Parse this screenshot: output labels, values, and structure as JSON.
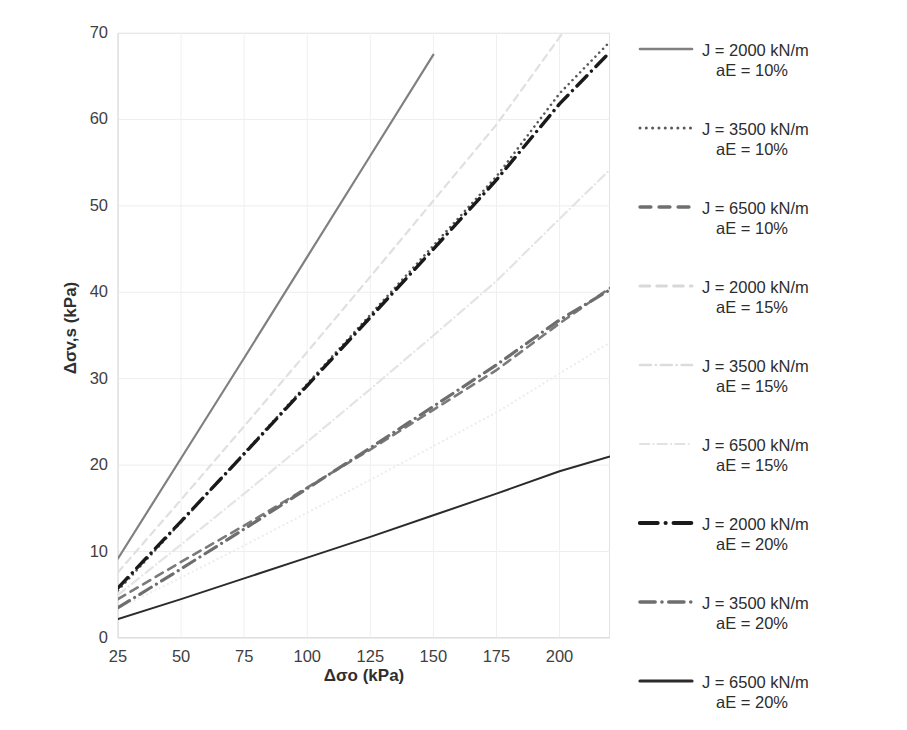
{
  "chart_data": {
    "type": "line",
    "title": "",
    "xlabel": "Δσo (kPa)",
    "ylabel": "Δσv,s (kPa)",
    "xlim": [
      25,
      220
    ],
    "ylim": [
      0,
      70
    ],
    "xticks": [
      25,
      50,
      75,
      100,
      125,
      150,
      175,
      200
    ],
    "yticks": [
      0,
      10,
      20,
      30,
      40,
      50,
      60,
      70
    ],
    "grid": true,
    "legend_position": "right",
    "series": [
      {
        "name": "J = 2000 kN/m  aE = 10%",
        "J": 2000,
        "aE": "10%",
        "style": "solid",
        "color": "#808080",
        "width": 2.2,
        "x": [
          25,
          50,
          75,
          100,
          125,
          150
        ],
        "y": [
          9.2,
          20.8,
          32.4,
          44.1,
          55.8,
          67.5
        ]
      },
      {
        "name": "J = 3500 kN/m  aE = 10%",
        "J": 3500,
        "aE": "10%",
        "style": "dotted",
        "color": "#595959",
        "width": 2.6,
        "x": [
          25,
          50,
          75,
          100,
          125,
          150,
          175,
          200,
          220
        ],
        "y": [
          5.5,
          13.4,
          21.4,
          29.4,
          37.4,
          45.4,
          53.4,
          63.0,
          69.0
        ]
      },
      {
        "name": "J = 6500 kN/m  aE = 10%",
        "J": 6500,
        "aE": "10%",
        "style": "dashed",
        "color": "#7a7a7a",
        "width": 2.6,
        "x": [
          25,
          50,
          75,
          100,
          125,
          150,
          175,
          200,
          220
        ],
        "y": [
          4.5,
          8.8,
          13.0,
          17.4,
          21.8,
          26.4,
          31.0,
          36.4,
          40.5
        ]
      },
      {
        "name": "J = 2000 kN/m  aE = 15%",
        "J": 2000,
        "aE": "15%",
        "style": "dashed",
        "color": "#e0e0e0",
        "width": 2.2,
        "x": [
          25,
          50,
          75,
          100,
          125,
          150,
          175,
          200,
          213
        ],
        "y": [
          7.6,
          16.0,
          24.5,
          33.1,
          41.8,
          50.6,
          59.4,
          69.5,
          75.0
        ]
      },
      {
        "name": "J = 3500 kN/m  aE = 15%",
        "J": 3500,
        "aE": "15%",
        "style": "dashdot",
        "color": "#e4e4e4",
        "width": 2.2,
        "x": [
          25,
          50,
          75,
          100,
          125,
          150,
          175,
          200,
          220
        ],
        "y": [
          5.0,
          10.8,
          16.7,
          22.7,
          28.8,
          35.0,
          41.3,
          48.5,
          54.2
        ]
      },
      {
        "name": "J = 6500 kN/m  aE = 15%",
        "J": 6500,
        "aE": "15%",
        "style": "dotted",
        "color": "#ececec",
        "width": 2.2,
        "x": [
          25,
          50,
          75,
          100,
          125,
          150,
          175,
          200,
          220
        ],
        "y": [
          3.4,
          7.0,
          10.7,
          14.5,
          18.3,
          22.2,
          26.1,
          30.6,
          34.2
        ]
      },
      {
        "name": "J = 2000 kN/m  aE = 20%",
        "J": 2000,
        "aE": "20%",
        "style": "dashdot",
        "color": "#1a1a1a",
        "width": 3.4,
        "x": [
          25,
          50,
          75,
          100,
          125,
          150,
          175,
          200,
          220
        ],
        "y": [
          5.8,
          13.5,
          21.3,
          29.2,
          37.1,
          45.0,
          53.0,
          61.8,
          67.8
        ]
      },
      {
        "name": "J = 3500 kN/m  aE = 20%",
        "J": 3500,
        "aE": "20%",
        "style": "dashdot",
        "color": "#6e6e6e",
        "width": 3.2,
        "x": [
          25,
          50,
          75,
          100,
          125,
          150,
          175,
          200,
          220
        ],
        "y": [
          3.5,
          8.0,
          12.6,
          17.3,
          22.0,
          26.8,
          31.6,
          36.8,
          40.3
        ]
      },
      {
        "name": "J = 6500 kN/m  aE = 20%",
        "J": 6500,
        "aE": "20%",
        "style": "solid",
        "color": "#2b2b2b",
        "width": 2.0,
        "x": [
          25,
          50,
          75,
          100,
          125,
          150,
          175,
          200,
          220
        ],
        "y": [
          2.2,
          4.5,
          6.9,
          9.3,
          11.7,
          14.2,
          16.7,
          19.3,
          21.0
        ]
      }
    ]
  },
  "legend": {
    "items": [
      {
        "line1": "J = 2000 kN/m",
        "line2": "aE = 10%",
        "style": "solid",
        "color": "#808080",
        "width": 2.6
      },
      {
        "line1": "J = 3500 kN/m",
        "line2": "aE = 10%",
        "style": "dotted",
        "color": "#595959",
        "width": 3.0
      },
      {
        "line1": "J = 6500 kN/m",
        "line2": "aE = 10%",
        "style": "dashed",
        "color": "#6f6f6f",
        "width": 3.4
      },
      {
        "line1": "J = 2000 kN/m",
        "line2": "aE = 15%",
        "style": "dashed",
        "color": "#d8d8d8",
        "width": 3.0
      },
      {
        "line1": "J = 3500 kN/m",
        "line2": "aE = 15%",
        "style": "dashdot",
        "color": "#dcdcdc",
        "width": 2.6
      },
      {
        "line1": "J = 6500 kN/m",
        "line2": "aE = 15%",
        "style": "dashdot",
        "color": "#e2e2e2",
        "width": 2.2
      },
      {
        "line1": "J = 2000 kN/m",
        "line2": "aE = 20%",
        "style": "dashdot",
        "color": "#1a1a1a",
        "width": 4.2
      },
      {
        "line1": "J = 3500 kN/m",
        "line2": "aE = 20%",
        "style": "dashdot",
        "color": "#6e6e6e",
        "width": 3.6
      },
      {
        "line1": "J = 6500 kN/m",
        "line2": "aE = 20%",
        "style": "solid",
        "color": "#2b2b2b",
        "width": 3.2
      }
    ]
  },
  "caption": {
    "text": ""
  }
}
